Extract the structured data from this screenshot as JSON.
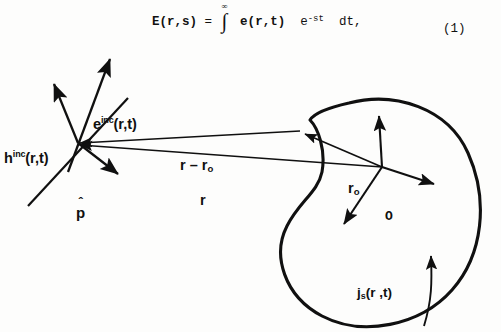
{
  "equation": {
    "lhs": "E(",
    "lhs_var": "r",
    "lhs_tail": ",s)",
    "equals": "=",
    "integral_upper": "∞",
    "integral_lower": "0",
    "integrand_head": "e(",
    "integrand_var": "r",
    "integrand_tail": ",t)",
    "exponential_base": "e",
    "exponential_exp": "-st",
    "differential": "dt,",
    "number": "(1)"
  },
  "figure": {
    "caption_labels": {
      "h_incident": {
        "base": "h",
        "superscript": "inc",
        "args": "(r,t)"
      },
      "e_incident": {
        "base": "e",
        "superscript": "inc",
        "args": "(r,t)"
      },
      "p_hat": {
        "base": "p",
        "hat": "ˆ"
      },
      "r_minus_r0": {
        "text": "r – r",
        "subscript": "o"
      },
      "r_vector": {
        "text": "r"
      },
      "r0_vector": {
        "base": "r",
        "subscript": "o"
      },
      "origin": {
        "text": "O"
      },
      "surface_current": {
        "base": "j",
        "subscript": "s",
        "args": "(r ,t)"
      }
    },
    "colors": {
      "ink": "#101010",
      "background": "#fdfdfc",
      "body_outline": "#101010"
    },
    "geometry": {
      "observation_point": [
        78,
        93
      ],
      "origin_point": [
        382,
        117
      ],
      "body_type": "kidney-shaped-scatterer"
    }
  }
}
